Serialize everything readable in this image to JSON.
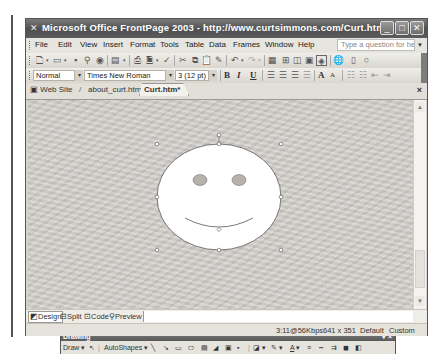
{
  "window": {
    "title": "Microsoft Office FrontPage 2003 - http://www.curtsimmons.com/Curt.htm",
    "controls": {
      "minimize": "_",
      "maximize": "□",
      "close": "✕"
    }
  },
  "menubar": {
    "items": [
      "File",
      "Edit",
      "View",
      "Insert",
      "Format",
      "Tools",
      "Table",
      "Data",
      "Frames",
      "Window",
      "Help"
    ],
    "help_placeholder": "Type a question for help"
  },
  "standard_toolbar": {
    "icons": [
      "new-page-icon",
      "open-icon",
      "save-icon",
      "search-icon",
      "publish-icon",
      "toggle-pane-icon",
      "print-icon",
      "print-preview-icon",
      "spelling-icon",
      "cut-icon",
      "copy-icon",
      "paste-icon",
      "format-painter-icon",
      "undo-icon",
      "redo-icon",
      "web-component-icon",
      "insert-table-icon",
      "insert-layer-icon",
      "insert-picture-icon",
      "drawing-icon",
      "hyperlink-icon",
      "folder-list-icon",
      "show-all-icon"
    ]
  },
  "formatting_toolbar": {
    "style": "Normal",
    "font": "Times New Roman",
    "size": "3 (12 pt)",
    "bold": "B",
    "italic": "I",
    "underline": "U",
    "grow_font": "A",
    "shrink_font": "A"
  },
  "tabs": {
    "web_site": "Web Site",
    "items": [
      "about_curt.htm",
      "Curt.htm*"
    ],
    "active": "Curt.htm*",
    "close": "×"
  },
  "canvas": {
    "shape": "smiley-face",
    "selected": true
  },
  "drawing_toolbar": {
    "title": "Drawing",
    "draw_label": "Draw",
    "autoshapes_label": "AutoShapes",
    "menu_glyph": "▾",
    "close": "×"
  },
  "view_tabs": {
    "items": [
      "Design",
      "Split",
      "Code",
      "Preview"
    ],
    "active": "Design"
  },
  "status_bar": {
    "download_time": "3:11@56Kbps",
    "page_size": "641 x 351",
    "default_label": "Default",
    "custom_label": "Custom"
  }
}
